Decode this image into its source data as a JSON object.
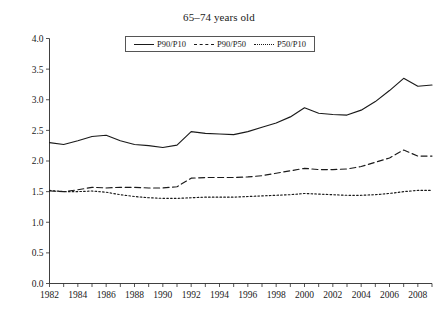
{
  "figure": {
    "caption_fragment": "",
    "title": "65–74 years old"
  },
  "legend": {
    "items": [
      {
        "label": "P90/P10",
        "style": "solid"
      },
      {
        "label": "P90/P50",
        "style": "dashed"
      },
      {
        "label": "P50/P10",
        "style": "dotted"
      }
    ]
  },
  "axes": {
    "y_ticks": [
      "0.0",
      "0.5",
      "1.0",
      "1.5",
      "2.0",
      "2.5",
      "3.0",
      "3.5",
      "4.0"
    ],
    "x_ticks": [
      "1982",
      "1984",
      "1986",
      "1988",
      "1990",
      "1992",
      "1994",
      "1996",
      "1998",
      "2000",
      "2002",
      "2004",
      "2006",
      "2008"
    ]
  },
  "chart_data": {
    "type": "line",
    "title": "65–74 years old",
    "xlabel": "",
    "ylabel": "",
    "ylim": [
      0.0,
      4.0
    ],
    "xlim": [
      1982,
      2009
    ],
    "ytick_step": 0.5,
    "grid": false,
    "legend_position": "top-center-inside",
    "x": [
      1982,
      1983,
      1984,
      1985,
      1986,
      1987,
      1988,
      1989,
      1990,
      1991,
      1992,
      1993,
      1994,
      1995,
      1996,
      1997,
      1998,
      1999,
      2000,
      2001,
      2002,
      2003,
      2004,
      2005,
      2006,
      2007,
      2008,
      2009
    ],
    "series": [
      {
        "name": "P90/P10",
        "style": "solid",
        "values": [
          2.3,
          2.27,
          2.33,
          2.4,
          2.42,
          2.33,
          2.27,
          2.25,
          2.22,
          2.26,
          2.48,
          2.45,
          2.44,
          2.43,
          2.48,
          2.55,
          2.62,
          2.72,
          2.87,
          2.78,
          2.76,
          2.75,
          2.83,
          2.97,
          3.15,
          3.35,
          3.22,
          3.24
        ]
      },
      {
        "name": "P90/P50",
        "style": "dashed",
        "values": [
          1.51,
          1.5,
          1.53,
          1.57,
          1.56,
          1.57,
          1.57,
          1.56,
          1.56,
          1.58,
          1.72,
          1.73,
          1.73,
          1.73,
          1.74,
          1.76,
          1.8,
          1.84,
          1.88,
          1.86,
          1.86,
          1.87,
          1.91,
          1.98,
          2.05,
          2.18,
          2.08,
          2.08
        ]
      },
      {
        "name": "P50/P10",
        "style": "dotted",
        "values": [
          1.52,
          1.5,
          1.5,
          1.51,
          1.49,
          1.45,
          1.42,
          1.4,
          1.39,
          1.39,
          1.4,
          1.41,
          1.41,
          1.41,
          1.42,
          1.43,
          1.44,
          1.45,
          1.47,
          1.46,
          1.45,
          1.44,
          1.44,
          1.45,
          1.47,
          1.5,
          1.52,
          1.52
        ]
      }
    ]
  }
}
